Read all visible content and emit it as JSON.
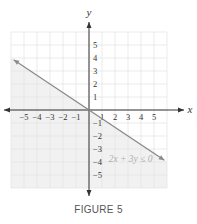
{
  "chart_data": {
    "type": "line",
    "title": "",
    "caption": "FIGURE 5",
    "xlabel": "x",
    "ylabel": "y",
    "xlim": [
      -6,
      6
    ],
    "ylim": [
      -6,
      6
    ],
    "grid": true,
    "x_ticks": [
      "-5",
      "-4",
      "-3",
      "-2",
      "-1",
      "1",
      "2",
      "3",
      "4",
      "5"
    ],
    "y_ticks": [
      "5",
      "4",
      "3",
      "2",
      "1",
      "-1",
      "-2",
      "-3",
      "-4",
      "-5"
    ],
    "series": [
      {
        "name": "2x + 3y = 0",
        "points": [
          [
            -6,
            4
          ],
          [
            6,
            -4
          ]
        ],
        "style": "solid",
        "arrows": "both"
      }
    ],
    "shaded_region": "below line (2x + 3y ≤ 0)",
    "annotations": [
      {
        "text": "2x + 3y ≤ 0",
        "x": 3.2,
        "y": -3.8
      }
    ]
  },
  "colors": {
    "line": "#8a8a8a",
    "grid": "#e2e2e2",
    "shade": "#f1f1f1",
    "axis": "#333333",
    "annotation": "#b0b0b0"
  }
}
